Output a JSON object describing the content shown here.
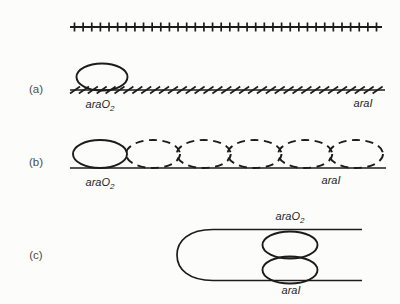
{
  "figure": {
    "kind": "dna-looping-diagram",
    "colors": {
      "background": "#fcfcfb",
      "stroke": "#1c1c1c",
      "site_label": "#262626",
      "panel_label": "#4d4d4d"
    }
  },
  "top_track": {
    "description": "dna-line-with-vertical-tick-marks",
    "tick_count": 36
  },
  "panels": {
    "a": {
      "label": "(a)",
      "left_site": {
        "base": "araO",
        "sub": "2"
      },
      "right_site": "araI",
      "hatch_count": 35
    },
    "b": {
      "label": "(b)",
      "left_site": {
        "base": "araO",
        "sub": "2"
      },
      "right_site": "araI",
      "dashed_ellipse_count": 5
    },
    "c": {
      "label": "(c)",
      "top_site": {
        "base": "araO",
        "sub": "2"
      },
      "bottom_site": "araI"
    }
  }
}
